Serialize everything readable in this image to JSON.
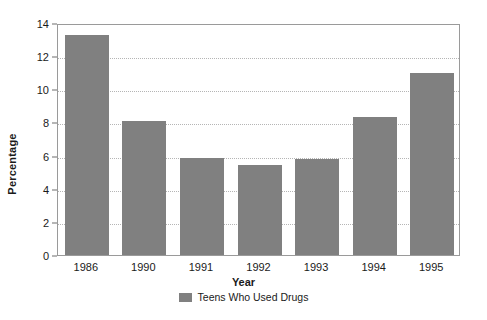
{
  "chart_data": {
    "type": "bar",
    "title": "",
    "xlabel": "Year",
    "ylabel": "Percentage",
    "categories": [
      "1986",
      "1990",
      "1991",
      "1992",
      "1993",
      "1994",
      "1995"
    ],
    "values": [
      13.3,
      8.1,
      5.85,
      5.45,
      5.8,
      8.35,
      11.0
    ],
    "series": [
      {
        "name": "Teens Who Used Drugs",
        "color": "#808080",
        "values": [
          13.3,
          8.1,
          5.85,
          5.45,
          5.8,
          8.35,
          11.0
        ]
      }
    ],
    "ylim": [
      0,
      14
    ],
    "ytick_step": 2,
    "yticks": [
      "0",
      "2",
      "4",
      "6",
      "8",
      "10",
      "12",
      "14"
    ],
    "grid": "horizontal-dotted",
    "legend_position": "bottom-center",
    "legend": [
      {
        "label": "Teens Who Used Drugs",
        "color": "#808080"
      }
    ]
  },
  "colors": {
    "bar": "#808080",
    "gridline": "#b5b5b5",
    "frame": "#9a9a9a",
    "text": "#1a1a1a",
    "background": "#ffffff"
  }
}
